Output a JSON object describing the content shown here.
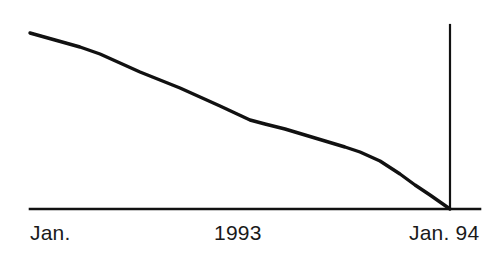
{
  "chart_data": {
    "type": "line",
    "title": "",
    "subtitle": "",
    "xlabel": "",
    "ylabel": "",
    "grid": false,
    "legend": null,
    "axis": {
      "baseline_color": "#111111",
      "marker_line_color": "#111111",
      "x_ticks": [
        "Jan.",
        "1993",
        "Jan. 94"
      ],
      "x_tick_positions": [
        0,
        0.5,
        1.0
      ],
      "xlim": [
        0,
        1
      ],
      "ylim": [
        0,
        1
      ]
    },
    "series": [
      {
        "name": "decline",
        "color": "#111111",
        "line_width": 3.4,
        "x": [
          0.0,
          0.06,
          0.12,
          0.167,
          0.214,
          0.262,
          0.31,
          0.357,
          0.405,
          0.452,
          0.488,
          0.524,
          0.56,
          0.607,
          0.655,
          0.702,
          0.75,
          0.786,
          0.833,
          0.881,
          0.917,
          0.952,
          0.976,
          1.0
        ],
        "y": [
          1.0,
          0.96,
          0.92,
          0.885,
          0.83,
          0.78,
          0.74,
          0.7,
          0.66,
          0.62,
          0.58,
          0.545,
          0.52,
          0.5,
          0.47,
          0.44,
          0.41,
          0.385,
          0.34,
          0.275,
          0.215,
          0.14,
          0.07,
          0.0
        ],
        "pixel_points": [
          [
            30,
            33
          ],
          [
            55,
            40
          ],
          [
            80,
            47
          ],
          [
            100,
            54
          ],
          [
            120,
            63
          ],
          [
            140,
            72
          ],
          [
            160,
            80
          ],
          [
            180,
            88
          ],
          [
            200,
            97
          ],
          [
            220,
            106
          ],
          [
            235,
            113
          ],
          [
            250,
            120
          ],
          [
            265,
            124
          ],
          [
            285,
            129
          ],
          [
            305,
            135
          ],
          [
            325,
            141
          ],
          [
            345,
            147
          ],
          [
            360,
            152
          ],
          [
            380,
            161
          ],
          [
            400,
            174
          ],
          [
            415,
            185
          ],
          [
            430,
            195
          ],
          [
            440,
            202
          ],
          [
            450,
            209
          ]
        ]
      }
    ],
    "annotations": [
      {
        "name": "end-marker-vertical-line",
        "x_pixel": 450,
        "y_top_pixel": 25,
        "y_bottom_pixel": 209
      }
    ]
  },
  "labels": {
    "start": "Jan.",
    "mid": "1993",
    "end": "Jan. 94"
  },
  "colors": {
    "ink": "#111111",
    "text": "#1a1a1a",
    "background": "#ffffff"
  }
}
